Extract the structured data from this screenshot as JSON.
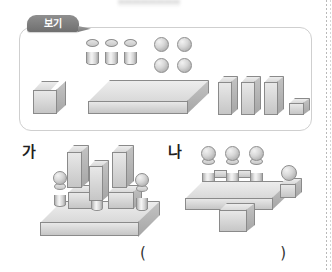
{
  "page": {
    "background_color": "#ffffff",
    "shape_fill_color": "#d9d9d9",
    "shape_outline_color": "#8a8a8a"
  },
  "example_box": {
    "tab_label": "보기",
    "contents": {
      "cylinders": {
        "count": 3,
        "icon": "cylinder-icon"
      },
      "spheres": {
        "count": 4,
        "icon": "sphere-icon",
        "arrangement": "2x2"
      },
      "cube_large": {
        "count": 1,
        "icon": "cube-icon"
      },
      "slab": {
        "count": 1,
        "icon": "flat-slab-icon"
      },
      "tall_blocks": {
        "count": 3,
        "icon": "tall-block-icon"
      },
      "cube_small": {
        "count": 1,
        "icon": "small-cube-icon"
      }
    }
  },
  "structures": [
    {
      "label": "가",
      "name": "structure-ga",
      "description": "flat slab base with cylinders topped by spheres, cuboids and tall blocks"
    },
    {
      "label": "나",
      "name": "structure-na",
      "description": "flat slab with cube underneath, three sphere-topped towers on top and a sphere on a cube at the right"
    }
  ],
  "answer": {
    "open_paren": "(",
    "close_paren": ")",
    "value": ""
  }
}
